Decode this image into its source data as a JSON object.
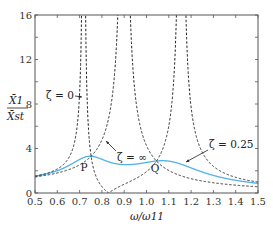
{
  "chart_data": {
    "type": "line",
    "title": "",
    "xlabel": "ω/ω11",
    "ylabel": "X1/Xst",
    "xlim": [
      0.5,
      1.5
    ],
    "ylim": [
      0,
      16
    ],
    "xticks": [
      0.5,
      0.6,
      0.7,
      0.8,
      0.9,
      1.0,
      1.1,
      1.2,
      1.3,
      1.4,
      1.5
    ],
    "xtick_labels": [
      "0.5",
      "0.6",
      "0.7",
      "0.8",
      "0.9",
      "1.0",
      "1.1",
      "1.2",
      "1.3",
      "1.4",
      "1.5"
    ],
    "yticks": [
      0,
      4,
      8,
      12,
      16
    ],
    "ytick_labels": [
      "0",
      "4",
      "8",
      "12",
      "16"
    ],
    "grid": false,
    "legend": "none (inline annotations)",
    "model": {
      "mass_ratio": 0.235,
      "tuning_ratio": 0.83
    },
    "series": [
      {
        "name": "ζ = 0",
        "style": "dashed",
        "color": "#222222",
        "description": "undamped: poles near ω/ω11≈0.72 and ≈1.15, zero (antiresonance) at ≈0.83"
      },
      {
        "name": "ζ = ∞",
        "style": "dashed",
        "color": "#222222",
        "description": "rigidly coupled: single pole near ω/ω11≈0.90"
      },
      {
        "name": "ζ = 0.25",
        "style": "solid",
        "color": "#3fa9e6",
        "description": "damped response, peaks ≈3.4 near 0.78 and ≈3.4 near 1.05, min ≈3.0 near 0.92"
      }
    ],
    "points": [
      {
        "label": "P",
        "x": 0.77,
        "y": 3.3
      },
      {
        "label": "Q",
        "x": 1.04,
        "y": 3.3
      }
    ],
    "annotations": [
      {
        "text": "ζ = 0",
        "arrow_to": [
          0.72,
          8.8
        ]
      },
      {
        "text": "ζ = ∞",
        "arrow_to": [
          0.88,
          5.8
        ]
      },
      {
        "text": "ζ = 0.25",
        "arrow_to": [
          1.17,
          1.9
        ]
      }
    ]
  },
  "labels": {
    "y_num": "X̄1",
    "y_den": "X̄st",
    "x_axis": "ω/ω11",
    "zeta0": "ζ = 0",
    "zetaInf": "ζ = ∞",
    "zeta025": "ζ = 0.25",
    "P": "P",
    "Q": "Q"
  }
}
